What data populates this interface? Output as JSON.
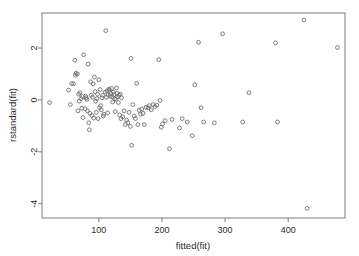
{
  "chart_data": {
    "type": "scatter",
    "title": "",
    "subtitle": "",
    "xlabel": "fitted(fit)",
    "ylabel": "rstandard(fit)",
    "xlim": [
      10,
      490
    ],
    "ylim": [
      -4.55,
      3.35
    ],
    "xticks": [
      100,
      200,
      300,
      400
    ],
    "xtick_labels": [
      "100",
      "200",
      "300",
      "400"
    ],
    "yticks": [
      2,
      0,
      -2,
      -4
    ],
    "ytick_labels": [
      "2",
      "0",
      "-2",
      "-4"
    ],
    "grid": false,
    "legend": "none",
    "marker": "open-circle",
    "marker_color": "#6f6f6f",
    "frame_color": "#7d7d7d",
    "background": "#ffffff",
    "n_points": 120,
    "annotations": [],
    "series": [
      {
        "name": "standardized residuals",
        "x": [
          22,
          52,
          55,
          57,
          60,
          62,
          63,
          64,
          66,
          67,
          68,
          69,
          70,
          72,
          73,
          74,
          75,
          76,
          78,
          79,
          80,
          81,
          82,
          83,
          84,
          85,
          86,
          87,
          88,
          89,
          90,
          91,
          92,
          93,
          94,
          95,
          96,
          97,
          98,
          99,
          100,
          101,
          102,
          103,
          104,
          105,
          106,
          107,
          108,
          110,
          111,
          112,
          113,
          114,
          115,
          116,
          117,
          118,
          119,
          120,
          121,
          122,
          123,
          124,
          125,
          126,
          127,
          128,
          129,
          130,
          131,
          132,
          133,
          134,
          135,
          136,
          138,
          140,
          142,
          144,
          146,
          148,
          150,
          151,
          152,
          154,
          156,
          158,
          160,
          162,
          164,
          166,
          168,
          170,
          172,
          175,
          178,
          180,
          183,
          186,
          189,
          192,
          195,
          197,
          199,
          201,
          205,
          212,
          216,
          228,
          232,
          240,
          248,
          252,
          258,
          262,
          266,
          283,
          296,
          328,
          338,
          380,
          383,
          425,
          430,
          478
        ],
        "y": [
          -0.1,
          0.38,
          -0.18,
          0.63,
          0.62,
          1.53,
          0.95,
          1.03,
          1.0,
          -0.42,
          0.22,
          -0.05,
          0.28,
          0.05,
          -0.32,
          0.13,
          -0.68,
          1.74,
          -0.34,
          0.15,
          0.08,
          0.02,
          -0.42,
          1.38,
          -0.88,
          -1.15,
          -0.52,
          0.7,
          0.18,
          -0.6,
          0.1,
          0.62,
          -0.7,
          0.88,
          0.32,
          -0.05,
          -0.48,
          0.05,
          0.22,
          -0.72,
          0.78,
          -0.3,
          0.4,
          -0.22,
          -0.38,
          0.08,
          0.18,
          -0.62,
          -0.55,
          0.3,
          2.67,
          0.1,
          0.35,
          -0.5,
          0.2,
          0.42,
          0.38,
          0.15,
          0.25,
          0.44,
          0.12,
          -0.08,
          0.3,
          0.2,
          0.05,
          -0.45,
          0.02,
          0.46,
          0.25,
          0.12,
          -0.1,
          0.18,
          -0.58,
          0.22,
          -0.72,
          0.08,
          -0.65,
          -0.42,
          -0.95,
          -0.78,
          -0.88,
          -0.48,
          -1.02,
          1.6,
          -1.75,
          -0.18,
          -0.62,
          -0.72,
          0.64,
          -0.95,
          -0.4,
          -0.55,
          -0.35,
          -0.52,
          -0.95,
          -0.28,
          -0.3,
          -0.22,
          -0.38,
          -0.18,
          -0.25,
          -0.2,
          1.55,
          -0.02,
          -1.05,
          -0.92,
          -0.8,
          -1.88,
          -0.75,
          -1.08,
          -0.72,
          -0.85,
          -1.38,
          0.58,
          2.22,
          -0.3,
          -0.85,
          -0.88,
          2.55,
          -0.85,
          0.28,
          2.2,
          -0.85,
          3.08,
          -4.18,
          2.02
        ]
      }
    ]
  },
  "geometry": {
    "plot_left": 42,
    "plot_right": 345,
    "plot_top": 13,
    "plot_bottom": 218
  }
}
